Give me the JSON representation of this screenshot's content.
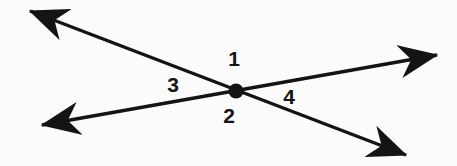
{
  "figure": {
    "name": "two-intersecting-lines-angle-diagram",
    "background_color": "#fbfbfb",
    "stroke_color": "#141414",
    "stroke_width": 3.4,
    "canvas": {
      "width": 457,
      "height": 166
    }
  },
  "intersection": {
    "label": "intersection-point",
    "x": 236,
    "y": 91,
    "radius": 7.5,
    "fill": "#141414"
  },
  "lines": [
    {
      "name": "line-upper-left-to-lower-right",
      "from": {
        "x": 30,
        "y": 11
      },
      "to": {
        "x": 406,
        "y": 155
      },
      "arrow_start": true,
      "arrow_end": true
    },
    {
      "name": "line-lower-left-to-upper-right",
      "from": {
        "x": 42,
        "y": 125
      },
      "to": {
        "x": 437,
        "y": 55
      },
      "arrow_start": true,
      "arrow_end": true
    }
  ],
  "arrowheads": [
    {
      "name": "arrowhead-upper-left",
      "tip_x": 30,
      "tip_y": 11
    },
    {
      "name": "arrowhead-lower-right",
      "tip_x": 406,
      "tip_y": 155
    },
    {
      "name": "arrowhead-lower-left",
      "tip_x": 42,
      "tip_y": 125
    },
    {
      "name": "arrowhead-upper-right",
      "tip_x": 437,
      "tip_y": 55
    }
  ],
  "labels": {
    "angle_1": "1",
    "angle_2": "2",
    "angle_3": "3",
    "angle_4": "4"
  },
  "label_positions": {
    "angle_1": {
      "x": 234,
      "y": 58,
      "region": "top"
    },
    "angle_2": {
      "x": 229,
      "y": 115,
      "region": "bottom"
    },
    "angle_3": {
      "x": 173,
      "y": 84,
      "region": "left"
    },
    "angle_4": {
      "x": 289,
      "y": 96,
      "region": "right"
    }
  }
}
